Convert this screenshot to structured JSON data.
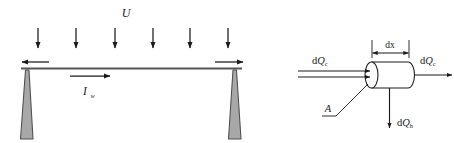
{
  "figure": {
    "background_color": "#ffffff",
    "line_color": "#1a1a1a",
    "beam_color": "#555555",
    "pylon_fill": "#a8a8a8",
    "pylon_stroke": "#4d4d4d"
  },
  "left_diagram": {
    "name": "beam-loading-diagram",
    "load_label": "U",
    "current_label_main": "I",
    "current_label_sub": "w",
    "load_arrow_count": 6,
    "beam_end_arrows": [
      "left",
      "right"
    ]
  },
  "right_diagram": {
    "name": "control-volume-heat-balance",
    "dimension_label": "dx",
    "area_label": "A",
    "inflow_label_prefix": "d",
    "inflow_label_main": "Q",
    "inflow_label_sub": "c",
    "outflow_label_prefix": "d",
    "outflow_label_main": "Q",
    "outflow_label_sub": "c",
    "loss_label_prefix": "d",
    "loss_label_main": "Q",
    "loss_label_sub": "h"
  }
}
